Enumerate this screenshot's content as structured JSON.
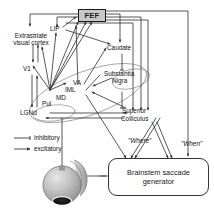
{
  "figure": {
    "type": "neuroanatomical-circuit-diagram",
    "background_color": "#ffffff",
    "line_color": "#3a3a3a",
    "accent_box_fill": "#c8c8c8"
  },
  "nodes": {
    "fef": {
      "label": "FEF",
      "style": "filled-box"
    },
    "lip": {
      "label": "LIP",
      "style": "text"
    },
    "extrastriate": {
      "label": "Extrastriate visual cortex",
      "line1": "Extrastriate",
      "line2": "visual cortex",
      "style": "text"
    },
    "v1": {
      "label": "V1",
      "style": "text"
    },
    "pul": {
      "label": "Pul",
      "style": "text-in-ellipse"
    },
    "lgnd": {
      "label": "LGNd",
      "style": "text-in-ellipse"
    },
    "va": {
      "label": "VA",
      "style": "text-in-ellipse"
    },
    "iml": {
      "label": "IML",
      "style": "text-in-ellipse"
    },
    "md": {
      "label": "MD",
      "style": "text-in-ellipse"
    },
    "caudate": {
      "label": "Caudate",
      "style": "text"
    },
    "substantia_nigra": {
      "label": "Substantia Nigra",
      "line1": "Substantia",
      "line2": "Nigra",
      "style": "text"
    },
    "superior_colliculus": {
      "label": "Superior Colliculus",
      "line1": "Superior",
      "line2": "Colliculus",
      "style": "text"
    },
    "brainstem": {
      "label": "Brainstem saccade generator",
      "style": "rounded-box"
    },
    "eye": {
      "label": "eye",
      "style": "shaded-sphere"
    }
  },
  "pathway_labels": {
    "where": "\"Where\"",
    "when": "\"When\""
  },
  "legend": {
    "items": [
      {
        "symbol": "tbar",
        "label": "inhibitory"
      },
      {
        "symbol": "arrow",
        "label": "excitatory"
      }
    ]
  }
}
